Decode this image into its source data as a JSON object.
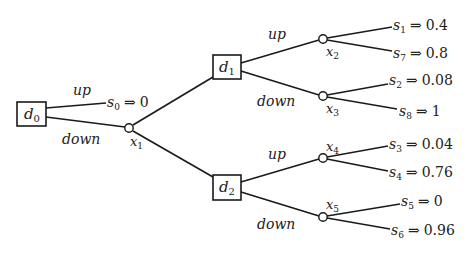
{
  "diagram": {
    "type": "decision-tree",
    "decision_nodes": [
      {
        "id": "d0",
        "name": "d",
        "sub": "0"
      },
      {
        "id": "d1",
        "name": "d",
        "sub": "1"
      },
      {
        "id": "d2",
        "name": "d",
        "sub": "2"
      }
    ],
    "chance_nodes": [
      {
        "id": "x1",
        "name": "x",
        "sub": "1"
      },
      {
        "id": "x2",
        "name": "x",
        "sub": "2"
      },
      {
        "id": "x3",
        "name": "x",
        "sub": "3"
      },
      {
        "id": "x4",
        "name": "x",
        "sub": "4"
      },
      {
        "id": "x5",
        "name": "x",
        "sub": "5"
      }
    ],
    "edge_labels": {
      "d0_up": "up",
      "d0_down": "down",
      "d1_up": "up",
      "d1_down": "down",
      "d2_up": "up",
      "d2_down": "down"
    },
    "arrow": "⇒",
    "outcomes": [
      {
        "id": "s0",
        "name": "s",
        "sub": "0",
        "value": "0"
      },
      {
        "id": "s1",
        "name": "s",
        "sub": "1",
        "value": "0.4"
      },
      {
        "id": "s7",
        "name": "s",
        "sub": "7",
        "value": "0.8"
      },
      {
        "id": "s2",
        "name": "s",
        "sub": "2",
        "value": "0.08"
      },
      {
        "id": "s8",
        "name": "s",
        "sub": "8",
        "value": "1"
      },
      {
        "id": "s3",
        "name": "s",
        "sub": "3",
        "value": "0.04"
      },
      {
        "id": "s4",
        "name": "s",
        "sub": "4",
        "value": "0.76"
      },
      {
        "id": "s5",
        "name": "s",
        "sub": "5",
        "value": "0"
      },
      {
        "id": "s6",
        "name": "s",
        "sub": "6",
        "value": "0.96"
      }
    ]
  }
}
